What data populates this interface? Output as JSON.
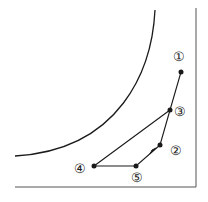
{
  "diagram": {
    "stroke_color": "#1a1a1a",
    "background": "#ffffff",
    "points": [
      {
        "id": "p1",
        "label": "①",
        "x": 181,
        "y": 72,
        "lx": 179,
        "ly": 61
      },
      {
        "id": "p3",
        "label": "③",
        "x": 170,
        "y": 110,
        "lx": 180,
        "ly": 116
      },
      {
        "id": "p2",
        "label": "②",
        "x": 160,
        "y": 145,
        "lx": 176,
        "ly": 155
      },
      {
        "id": "p5",
        "label": "⑤",
        "x": 136,
        "y": 166,
        "lx": 137,
        "ly": 181
      },
      {
        "id": "p4",
        "label": "④",
        "x": 94,
        "y": 166,
        "lx": 84,
        "ly": 173
      }
    ]
  }
}
